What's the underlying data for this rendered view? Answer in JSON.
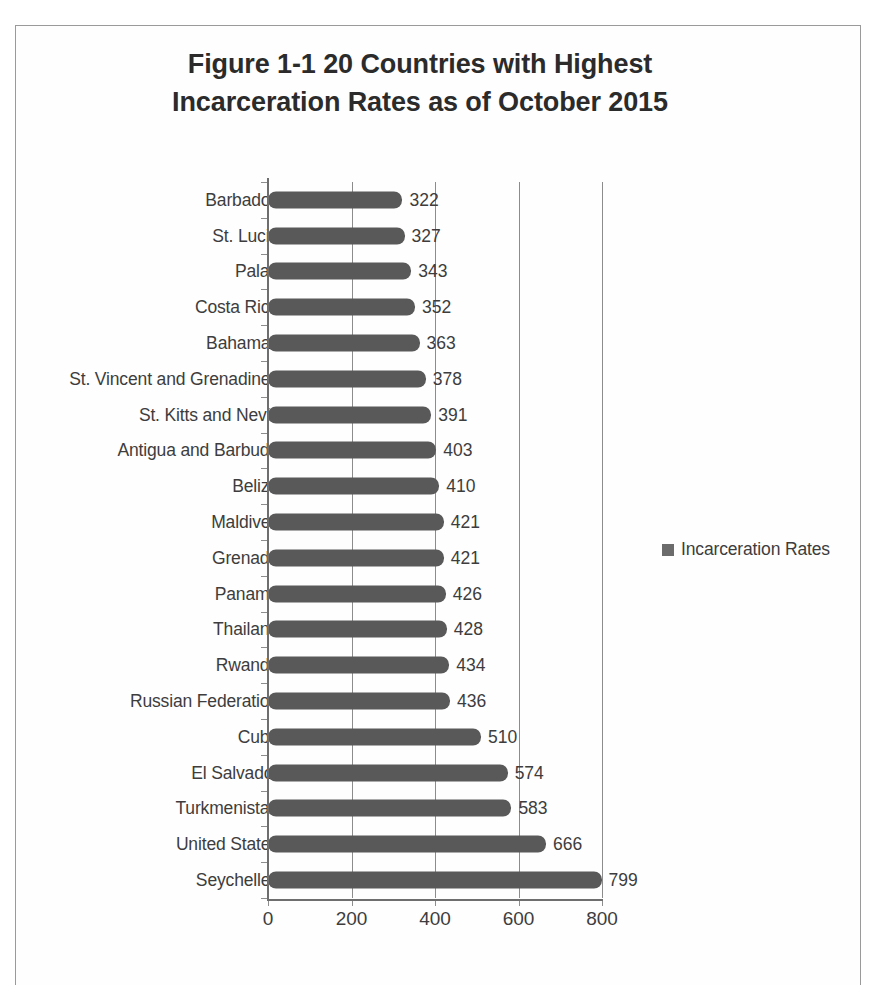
{
  "figure": {
    "title_line1": "Figure 1-1 20 Countries with Highest",
    "title_line2": "Incarceration Rates as of October 2015"
  },
  "legend": {
    "label": "Incarceration Rates",
    "swatch_color": "#6b6b6b",
    "position": "right"
  },
  "axis": {
    "x_ticks": [
      "0",
      "200",
      "400",
      "600",
      "800"
    ]
  },
  "chart_data": {
    "type": "bar",
    "orientation": "horizontal",
    "title": "Figure 1-1 20 Countries with Highest Incarceration Rates as of October 2015",
    "xlabel": "",
    "ylabel": "",
    "xlim": [
      0,
      800
    ],
    "grid": true,
    "legend": [
      "Incarceration Rates"
    ],
    "series_name": "Incarceration Rates",
    "bar_color": "#595959",
    "categories": [
      "Barbados",
      "St. Lucia",
      "Palau",
      "Costa Rica",
      "Bahamas",
      "St. Vincent and Grenadines",
      "St. Kitts and Nevis",
      "Antigua and Barbuda",
      "Belize",
      "Maldives",
      "Grenada",
      "Panama",
      "Thailand",
      "Rwanda",
      "Russian Federation",
      "Cuba",
      "El Salvador",
      "Turkmenistan",
      "United States",
      "Seychelles"
    ],
    "values": [
      322,
      327,
      343,
      352,
      363,
      378,
      391,
      403,
      410,
      421,
      421,
      426,
      428,
      434,
      436,
      510,
      574,
      583,
      666,
      799
    ],
    "value_labels": [
      "322",
      "327",
      "343",
      "352",
      "363",
      "378",
      "391",
      "403",
      "410",
      "421",
      "421",
      "426",
      "428",
      "434",
      "436",
      "510",
      "574",
      "583",
      "666",
      "799"
    ]
  }
}
